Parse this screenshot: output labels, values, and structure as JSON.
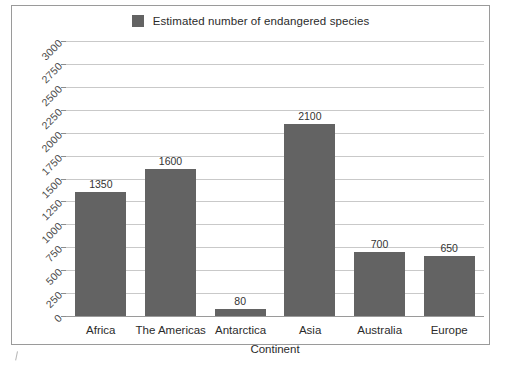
{
  "legend": {
    "label": "Estimated number of endangered species",
    "swatch_color": "#636363",
    "position": "top-center"
  },
  "axes": {
    "x_title": "Continent",
    "y_title": ""
  },
  "chart_data": {
    "type": "bar",
    "title": "",
    "subtitle": "",
    "xlabel": "Continent",
    "ylabel": "",
    "categories": [
      "Africa",
      "The Americas",
      "Antarctica",
      "Asia",
      "Australia",
      "Europe"
    ],
    "values": [
      1350,
      1600,
      80,
      2100,
      700,
      650
    ],
    "series": [
      {
        "name": "Estimated number of endangered species",
        "values": [
          1350,
          1600,
          80,
          2100,
          700,
          650
        ],
        "color": "#636363"
      }
    ],
    "data_labels": [
      "1350",
      "1600",
      "80",
      "2100",
      "700",
      "650"
    ],
    "ylim": [
      0,
      3000
    ],
    "ytick_step": 250,
    "yticks": [
      3000,
      2750,
      2500,
      2250,
      2000,
      1750,
      1500,
      1250,
      1000,
      750,
      500,
      250,
      0
    ],
    "ytick_labels": [
      "3000",
      "2750",
      "2500",
      "2250",
      "2000",
      "1750",
      "1500",
      "1250",
      "1000",
      "750",
      "500",
      "250",
      "0"
    ],
    "ytick_label_rotation_deg": -45,
    "grid": true,
    "grid_axis": "y",
    "legend": "top-center",
    "legend_entries": [
      "Estimated number of endangered species"
    ],
    "annotations": []
  },
  "colors": {
    "bar": "#636363",
    "gridline": "#c9c9c9",
    "axis": "#9a9a9a",
    "frame": "#9a9a9a",
    "text": "#2b2b2b",
    "background": "#ffffff"
  }
}
